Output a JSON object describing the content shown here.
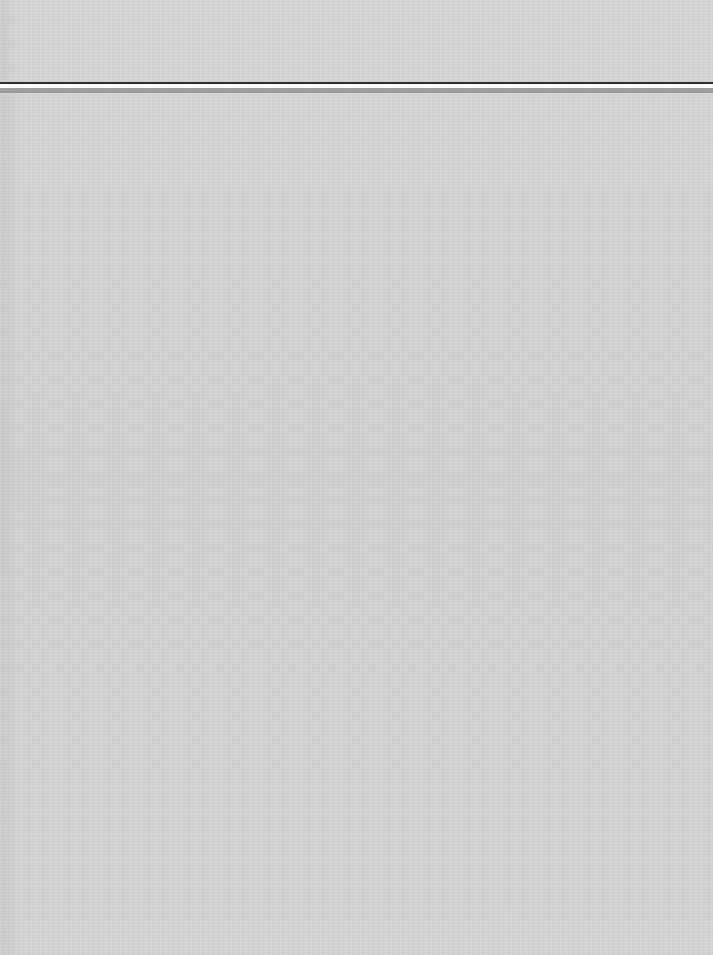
{
  "page": {
    "type": "blank scanned page",
    "background_color": "#d4d4d4",
    "header_rule": {
      "dark_line_color": "#2e2e2e",
      "gap_color": "#fbfbfb",
      "light_line_color": "#9c9c9c"
    },
    "text": ""
  }
}
